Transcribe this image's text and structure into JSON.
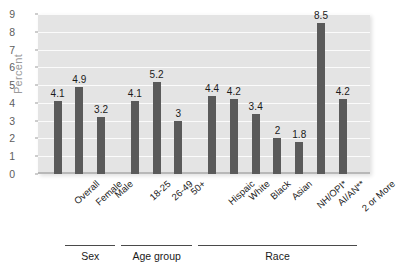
{
  "chart_data": {
    "type": "bar",
    "title": "",
    "xlabel": "",
    "ylabel": "Percent",
    "ylim": [
      0,
      9
    ],
    "ytick_labels": [
      "0",
      "1",
      "2",
      "3",
      "4",
      "5",
      "6",
      "7",
      "8",
      "9"
    ],
    "grid": true,
    "legend": "none",
    "categories": [
      "Overall",
      "Female",
      "Male",
      "18-25",
      "26-49",
      "50+",
      "Hispaic",
      "White",
      "Black",
      "Asian",
      "NH/OPI*",
      "AI/AN**",
      "2 or More"
    ],
    "values": [
      4.1,
      4.9,
      3.2,
      4.1,
      5.2,
      3,
      4.4,
      4.2,
      3.4,
      2,
      1.8,
      8.5,
      4.2
    ],
    "value_labels": [
      "4.1",
      "4.9",
      "3.2",
      "4.1",
      "5.2",
      "3",
      "4.4",
      "4.2",
      "3.4",
      "2",
      "1.8",
      "8.5",
      "4.2"
    ],
    "groups": [
      {
        "label": "Sex",
        "first": 1,
        "last": 2
      },
      {
        "label": "Age group",
        "first": 3,
        "last": 5
      },
      {
        "label": "Race",
        "first": 6,
        "last": 12
      }
    ],
    "colors": {
      "bar": "#5a5a5a",
      "plot_background": "#e4e4e4",
      "gridline": "#fbfbfb",
      "axis_text": "#5d5d5d",
      "ylabel_text": "#9a9a9a",
      "value_text": "#1a1a1a"
    }
  }
}
